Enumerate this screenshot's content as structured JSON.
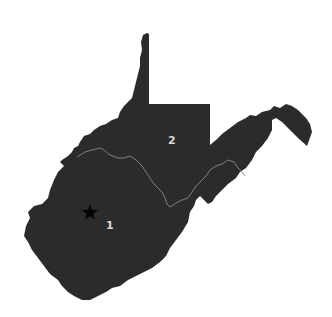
{
  "map": {
    "region": "West Virginia",
    "fill_color": "#2b2b2b",
    "boundary_color": "#8a8a8a",
    "background_color": "#ffffff",
    "districts": [
      {
        "id": "1",
        "label": "1",
        "x": 106,
        "y": 220
      },
      {
        "id": "2",
        "label": "2",
        "x": 168,
        "y": 135
      }
    ],
    "markers": [
      {
        "type": "capital",
        "icon": "star-icon",
        "x": 90,
        "y": 212
      }
    ]
  }
}
